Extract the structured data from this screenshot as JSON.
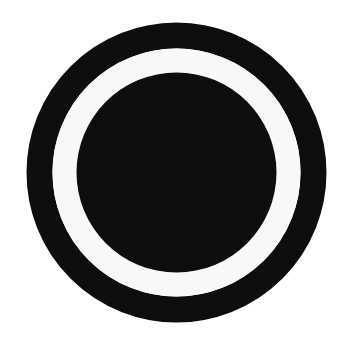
{
  "image": {
    "kind": "scanned-concentric-ring-mark",
    "description": "Thick black annulus with a white gap ring and a solid black inner disc on a white background",
    "width": 351,
    "height": 357,
    "background_color": "#ffffff",
    "texture": "scan-grain"
  },
  "geometry": {
    "center_x": 176.5,
    "center_y": 172.5,
    "outer_ring_outer_radius": 150,
    "outer_ring_inner_radius": 124,
    "outer_ring_stroke_width": 26,
    "gap_ring_outer_radius": 124,
    "gap_ring_inner_radius": 100,
    "gap_ring_width": 24,
    "inner_disc_radius": 100
  },
  "colors": {
    "ink_black": "#0d0d0d",
    "gap_white": "#f8f8f6",
    "background_white": "#ffffff"
  },
  "shapes": [
    {
      "name": "outer-ring",
      "type": "annulus",
      "fill": "#0d0d0d",
      "center_x": 176.5,
      "center_y": 172.5,
      "radius": 137,
      "stroke_width": 26
    },
    {
      "name": "gap-ring",
      "type": "annulus",
      "fill": "#f8f8f6",
      "center_x": 176.5,
      "center_y": 172.5,
      "radius": 112,
      "stroke_width": 24
    },
    {
      "name": "inner-disc",
      "type": "circle",
      "fill": "#0d0d0d",
      "center_x": 176.5,
      "center_y": 172.5,
      "radius": 100
    }
  ]
}
